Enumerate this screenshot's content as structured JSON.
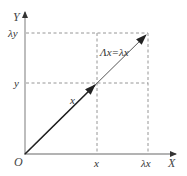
{
  "diagram": {
    "type": "vector-scaling",
    "axes": {
      "x_label": "X",
      "y_label": "Y",
      "origin_label": "O"
    },
    "ticks": {
      "x_tick": "x",
      "lambda_x_tick": "λx",
      "y_tick": "y",
      "lambda_y_tick": "λy"
    },
    "vectors": {
      "original_label": "x",
      "transformed_label": "Λx=λx"
    },
    "colors": {
      "axis": "#9a9a9a",
      "dashed": "#8a8a8a",
      "vector": "#333333",
      "text": "#333333"
    }
  }
}
